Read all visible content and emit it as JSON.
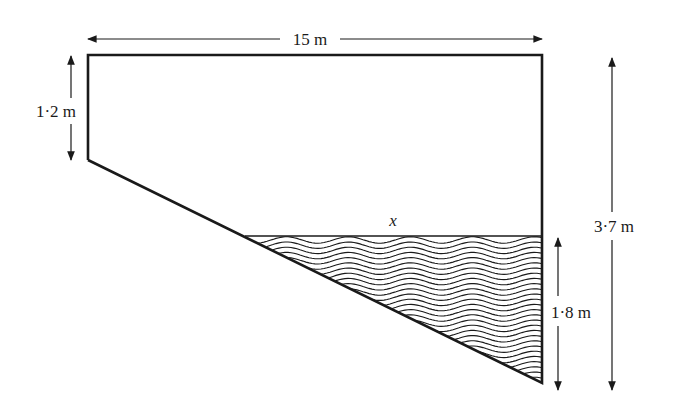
{
  "diagram": {
    "type": "cross-section of a pool partially filled with water",
    "labels": {
      "top_width": "15 m",
      "left_depth": "1·2 m",
      "total_depth": "3·7 m",
      "water_depth": "1·8 m",
      "water_surface_width": "x"
    },
    "colors": {
      "line": "#1a1a1a",
      "background": "#ffffff"
    }
  }
}
